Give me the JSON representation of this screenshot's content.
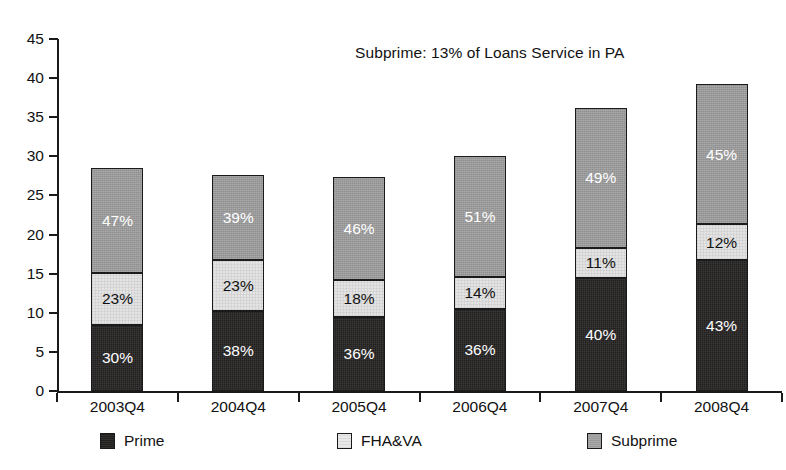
{
  "chart_data": {
    "type": "bar",
    "stacked": true,
    "title": "Subprime: 13% of Loans Service in PA",
    "xlabel": "",
    "ylabel": "",
    "ylim": [
      0,
      45
    ],
    "ytick_step": 5,
    "yticks": [
      0,
      5,
      10,
      15,
      20,
      25,
      30,
      35,
      40,
      45
    ],
    "grid": false,
    "legend_position": "bottom",
    "categories": [
      "2003Q4",
      "2004Q4",
      "2005Q4",
      "2006Q4",
      "2007Q4",
      "2008Q4"
    ],
    "series": [
      {
        "name": "Prime",
        "color": "#221f1f",
        "values": [
          8.5,
          10.2,
          9.4,
          10.5,
          14.4,
          16.7
        ],
        "labels": [
          "30%",
          "38%",
          "36%",
          "36%",
          "40%",
          "43%"
        ]
      },
      {
        "name": "FHA&VA",
        "color": "#e3e3e3",
        "values": [
          6.6,
          6.5,
          4.8,
          4.1,
          3.9,
          4.6
        ],
        "labels": [
          "23%",
          "23%",
          "18%",
          "14%",
          "11%",
          "12%"
        ]
      },
      {
        "name": "Subprime",
        "color": "#9a9a9a",
        "values": [
          13.4,
          10.9,
          13.2,
          15.4,
          17.9,
          17.9
        ],
        "labels": [
          "47%",
          "39%",
          "46%",
          "51%",
          "49%",
          "45%"
        ]
      }
    ],
    "totals": [
      28.5,
      27.6,
      27.4,
      30.0,
      36.2,
      39.2
    ]
  },
  "annotation": {
    "text": "Subprime: 13% of Loans Service in PA"
  },
  "axis": {
    "y_labels": [
      "45",
      "40",
      "35",
      "30",
      "25",
      "20",
      "15",
      "10",
      "5",
      "0"
    ],
    "x_labels": [
      "2003Q4",
      "2004Q4",
      "2005Q4",
      "2006Q4",
      "2007Q4",
      "2008Q4"
    ]
  },
  "legend": {
    "items": [
      {
        "label": "Prime",
        "swatch": "prime"
      },
      {
        "label": "FHA&VA",
        "swatch": "fhava"
      },
      {
        "label": "Subprime",
        "swatch": "subprime"
      }
    ]
  },
  "bars": [
    {
      "category": "2003Q4",
      "segments": [
        {
          "series": "Subprime",
          "label": "47%"
        },
        {
          "series": "FHA&VA",
          "label": "23%"
        },
        {
          "series": "Prime",
          "label": "30%"
        }
      ]
    },
    {
      "category": "2004Q4",
      "segments": [
        {
          "series": "Subprime",
          "label": "39%"
        },
        {
          "series": "FHA&VA",
          "label": "23%"
        },
        {
          "series": "Prime",
          "label": "38%"
        }
      ]
    },
    {
      "category": "2005Q4",
      "segments": [
        {
          "series": "Subprime",
          "label": "46%"
        },
        {
          "series": "FHA&VA",
          "label": "18%"
        },
        {
          "series": "Prime",
          "label": "36%"
        }
      ]
    },
    {
      "category": "2006Q4",
      "segments": [
        {
          "series": "Subprime",
          "label": "51%"
        },
        {
          "series": "FHA&VA",
          "label": "14%"
        },
        {
          "series": "Prime",
          "label": "36%"
        }
      ]
    },
    {
      "category": "2007Q4",
      "segments": [
        {
          "series": "Subprime",
          "label": "49%"
        },
        {
          "series": "FHA&VA",
          "label": "11%"
        },
        {
          "series": "Prime",
          "label": "40%"
        }
      ]
    },
    {
      "category": "2008Q4",
      "segments": [
        {
          "series": "Subprime",
          "label": "45%"
        },
        {
          "series": "FHA&VA",
          "label": "12%"
        },
        {
          "series": "Prime",
          "label": "43%"
        }
      ]
    }
  ]
}
